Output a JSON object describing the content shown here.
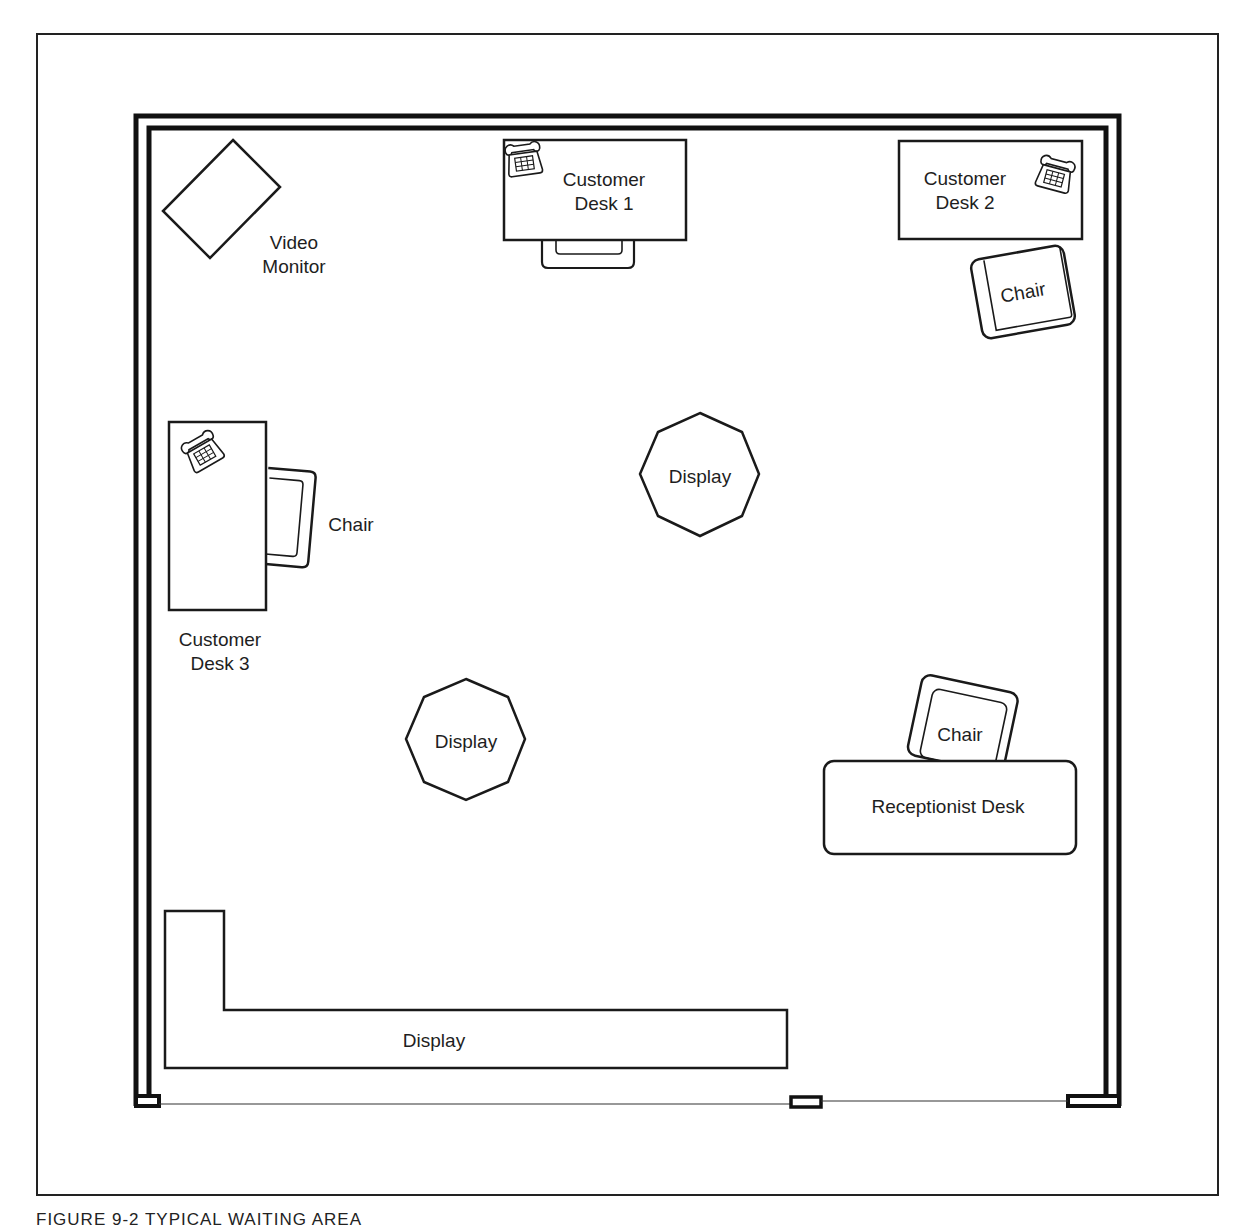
{
  "figure": {
    "caption": "FIGURE 9-2  TYPICAL WAITING AREA"
  },
  "room": {
    "outer_wall_color": "#111111",
    "line_color": "#1a1a1a"
  },
  "items": {
    "video_monitor": {
      "line1": "Video",
      "line2": "Monitor"
    },
    "customer_desk_1": {
      "line1": "Customer",
      "line2": "Desk 1",
      "has_phone": true
    },
    "customer_desk_2": {
      "line1": "Customer",
      "line2": "Desk 2",
      "has_phone": true
    },
    "customer_desk_3": {
      "line1": "Customer",
      "line2": "Desk 3",
      "has_phone": true
    },
    "chair_desk_2": {
      "label": "Chair"
    },
    "chair_desk_3": {
      "label": "Chair"
    },
    "chair_reception": {
      "label": "Chair"
    },
    "display_octagon_1": {
      "label": "Display"
    },
    "display_octagon_2": {
      "label": "Display"
    },
    "display_l_shaped": {
      "label": "Display"
    },
    "receptionist_desk": {
      "label": "Receptionist Desk"
    }
  }
}
